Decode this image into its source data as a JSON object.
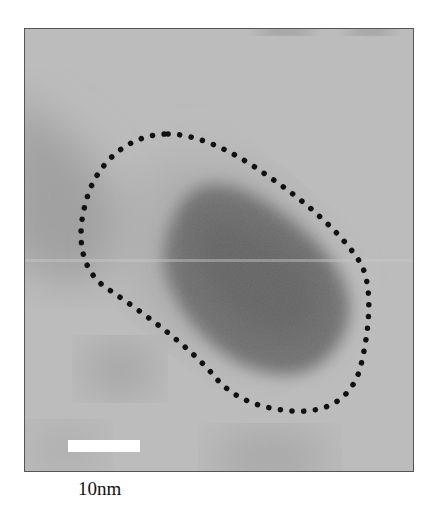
{
  "micrograph": {
    "description": "TEM micrograph of a dark elongated nanoparticle outlined by a dotted boundary",
    "background_color": "#b9b9b9",
    "particle_color": "#6a6a6a",
    "outline_color": "#111111"
  },
  "scale_bar": {
    "label": "10nm",
    "color": "#ffffff"
  }
}
